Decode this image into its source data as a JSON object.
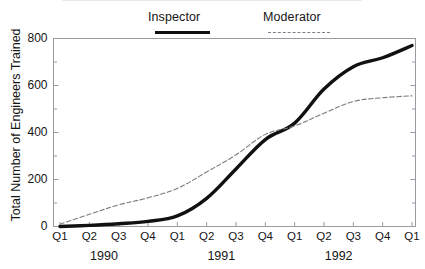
{
  "chart_data": {
    "type": "line",
    "title": "",
    "xlabel": "",
    "ylabel": "Total Number of Engineers Trained",
    "ylim": [
      0,
      800
    ],
    "yticks": [
      0,
      200,
      400,
      600,
      800
    ],
    "yticks_minor_step": 100,
    "grid": false,
    "legend_position": "top",
    "categories": [
      "Q1",
      "Q2",
      "Q3",
      "Q4",
      "Q1",
      "Q2",
      "Q3",
      "Q4",
      "Q1",
      "Q2",
      "Q3",
      "Q4",
      "Q1"
    ],
    "group_labels": [
      "1990",
      "1991",
      "1992"
    ],
    "groups": [
      {
        "label": "1990",
        "start_index": 0,
        "end_index": 3
      },
      {
        "label": "1991",
        "start_index": 4,
        "end_index": 7
      },
      {
        "label": "1992",
        "start_index": 8,
        "end_index": 11
      }
    ],
    "series": [
      {
        "name": "Inspector",
        "style": "solid",
        "color": "#111111",
        "width": 3.4,
        "values": [
          0,
          5,
          12,
          22,
          45,
          120,
          245,
          370,
          440,
          585,
          680,
          718,
          770
        ]
      },
      {
        "name": "Moderator",
        "style": "dashed",
        "color": "#7a7a82",
        "width": 1.1,
        "values": [
          10,
          52,
          92,
          122,
          162,
          232,
          305,
          392,
          428,
          482,
          532,
          548,
          556
        ]
      }
    ]
  },
  "legend": {
    "inspector": "Inspector",
    "moderator": "Moderator"
  },
  "axis": {
    "y_title": "Total Number of Engineers Trained",
    "y_tick_labels": [
      "800",
      "600",
      "400",
      "200",
      "0"
    ],
    "x_tick_labels": [
      "Q1",
      "Q2",
      "Q3",
      "Q4",
      "Q1",
      "Q2",
      "Q3",
      "Q4",
      "Q1",
      "Q2",
      "Q3",
      "Q4",
      "Q1"
    ],
    "year_labels": [
      "1990",
      "1991",
      "1992"
    ]
  },
  "colors": {
    "inspector": "#111111",
    "moderator": "#7a7a82",
    "frame": "#9a9aa2",
    "text": "#151515"
  }
}
